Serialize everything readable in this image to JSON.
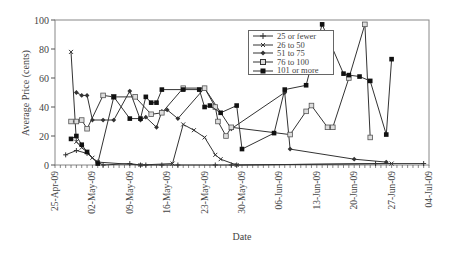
{
  "chart_data": {
    "type": "line",
    "title": "",
    "xlabel": "Date",
    "ylabel": "Average Price (cents)",
    "ylim": [
      0,
      100
    ],
    "yticks": [
      0,
      20,
      40,
      60,
      80,
      100
    ],
    "x_start_date": "25-Apr-09",
    "x_range_days": [
      0,
      70
    ],
    "xtick_labels": [
      "25-Apr-09",
      "02-May-09",
      "09-May-09",
      "16-May-09",
      "23-May-09",
      "30-May-09",
      "06-Jun-09",
      "13-Jun-09",
      "20-Jun-09",
      "27-Jun-09",
      "04-Jul-09"
    ],
    "xtick_days": [
      0,
      7,
      14,
      21,
      28,
      35,
      42,
      49,
      56,
      63,
      70
    ],
    "grid": false,
    "legend_position": "upper-center",
    "series": [
      {
        "name": "25 or fewer",
        "marker": "plus",
        "x": [
          2,
          4,
          6,
          8,
          9,
          14,
          16,
          17,
          20,
          23,
          30,
          33,
          34,
          60,
          69
        ],
        "values": [
          7,
          10,
          8,
          2,
          0,
          1,
          0,
          0,
          0,
          0,
          0,
          0,
          0,
          1,
          1
        ]
      },
      {
        "name": "26 to 50",
        "marker": "cross",
        "x": [
          3,
          4,
          5,
          6,
          7,
          8,
          16,
          22,
          24,
          26,
          28,
          30,
          31,
          34,
          63
        ],
        "values": [
          78,
          16,
          12,
          9,
          5,
          2,
          0,
          1,
          28,
          24,
          19,
          7,
          4,
          0,
          1
        ]
      },
      {
        "name": "51 to 75",
        "marker": "diamond",
        "x": [
          4,
          5,
          6,
          7,
          9,
          11,
          14,
          16,
          17,
          19,
          20,
          21,
          23,
          28,
          33,
          43,
          44,
          56,
          62
        ],
        "values": [
          50,
          48,
          48,
          31,
          31,
          31,
          51,
          31,
          33,
          26,
          37,
          38,
          32,
          53,
          25,
          50,
          11,
          4,
          2
        ]
      },
      {
        "name": "76 to 100",
        "marker": "open-square",
        "x": [
          3,
          4,
          5,
          6,
          9,
          11,
          15,
          18,
          20,
          24,
          28,
          30,
          30.5,
          32,
          33,
          44,
          47,
          48,
          51,
          52,
          55,
          58,
          59
        ],
        "values": [
          30,
          30,
          31,
          25,
          48,
          47,
          47,
          35,
          36,
          53,
          53,
          40,
          30,
          20,
          26,
          21,
          37,
          41,
          26,
          26,
          60,
          97,
          19
        ]
      },
      {
        "name": "101 or more",
        "marker": "filled-square",
        "x": [
          3,
          4,
          5,
          6,
          8,
          11,
          14,
          16,
          17,
          18,
          19,
          20,
          24,
          27,
          28,
          29,
          31,
          34,
          35,
          41,
          43,
          47,
          50,
          54,
          55,
          57,
          59,
          62,
          63
        ],
        "values": [
          18,
          20,
          14,
          9,
          1,
          47,
          32,
          32,
          47,
          43,
          43,
          52,
          52,
          52,
          40,
          41,
          36,
          41,
          11,
          22,
          52,
          55,
          97,
          63,
          62,
          61,
          58,
          21,
          73
        ]
      }
    ]
  }
}
